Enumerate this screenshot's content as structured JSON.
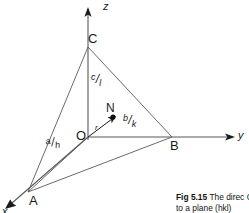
{
  "figure": {
    "axes": [
      {
        "name": "z-axis",
        "label": "z",
        "direction": "up"
      },
      {
        "name": "y-axis",
        "label": "y",
        "direction": "right"
      },
      {
        "name": "x-axis",
        "label": "x",
        "direction": "down-left"
      }
    ],
    "vertices": [
      {
        "name": "origin",
        "label": "O"
      },
      {
        "name": "intercept-z",
        "label": "C"
      },
      {
        "name": "intercept-y",
        "label": "B"
      },
      {
        "name": "intercept-x",
        "label": "A"
      },
      {
        "name": "foot-of-normal",
        "label": "N"
      }
    ],
    "intercepts": [
      {
        "name": "intercept-a-over-h",
        "numerator": "a",
        "bar": "/",
        "denominator": "h"
      },
      {
        "name": "intercept-b-over-k",
        "numerator": "b",
        "bar": "/",
        "denominator": "k"
      },
      {
        "name": "intercept-c-over-l",
        "numerator": "c",
        "bar": "/",
        "denominator": "l"
      }
    ],
    "normal_vector_label": "r",
    "colors": {
      "ink": "#1a1a1a",
      "line": "#595959",
      "background": "#ffffff"
    }
  },
  "caption": {
    "figure_number": "Fig 5.15",
    "text_line_1": "The direc",
    "text_line_2": "O to a plane (hkl)"
  }
}
